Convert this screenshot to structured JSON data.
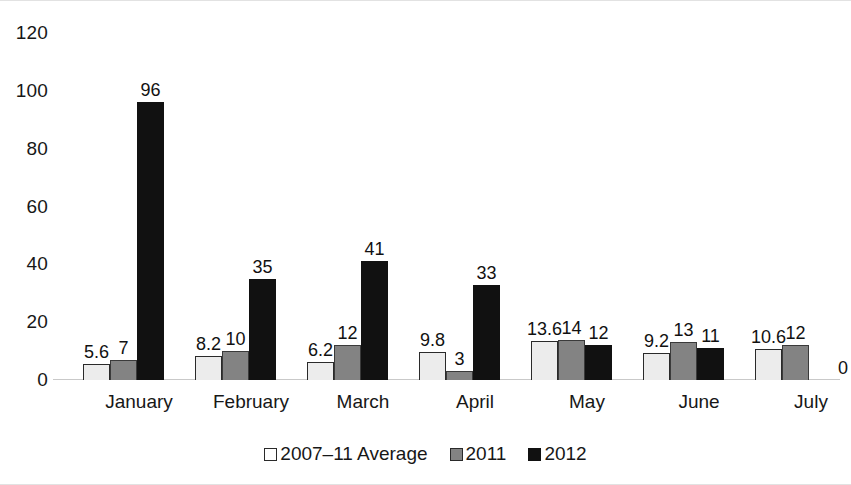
{
  "chart_data": {
    "type": "bar",
    "title": "",
    "xlabel": "",
    "ylabel": "",
    "ylim": [
      0,
      120
    ],
    "yticks": [
      0,
      20,
      40,
      60,
      80,
      100,
      120
    ],
    "grid": false,
    "legend_position": "bottom",
    "categories": [
      "January",
      "February",
      "March",
      "April",
      "May",
      "June",
      "July"
    ],
    "series": [
      {
        "name": "2007–11 Average",
        "color": "#ececec",
        "values": [
          5.6,
          8.2,
          6.2,
          9.8,
          13.6,
          9.2,
          10.6
        ],
        "labels": [
          "5.6",
          "8.2",
          "6.2",
          "9.8",
          "13.6",
          "9.2",
          "10.6"
        ]
      },
      {
        "name": "2011",
        "color": "#838383",
        "values": [
          7,
          10,
          12,
          3,
          14,
          13,
          12
        ],
        "labels": [
          "7",
          "10",
          "12",
          "3",
          "14",
          "13",
          "12"
        ]
      },
      {
        "name": "2012",
        "color": "#111111",
        "values": [
          96,
          35,
          41,
          33,
          12,
          11,
          0
        ],
        "labels": [
          "96",
          "35",
          "41",
          "33",
          "12",
          "11",
          "0"
        ]
      }
    ]
  }
}
